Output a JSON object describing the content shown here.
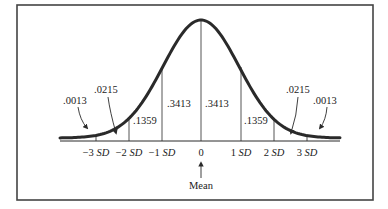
{
  "diagram": {
    "colors": {
      "line": "#2a2a2a",
      "border": "#444444",
      "background": "#ffffff"
    },
    "areas": {
      "center_left": ".3413",
      "center_right": ".3413",
      "mid_left": ".1359",
      "mid_right": ".1359",
      "outer_left": ".0215",
      "outer_right": ".0215",
      "tail_left": ".0013",
      "tail_right": ".0013"
    },
    "axis_ticks": [
      {
        "num": "−3",
        "unit": "SD"
      },
      {
        "num": "−2",
        "unit": "SD"
      },
      {
        "num": "−1",
        "unit": "SD"
      },
      {
        "num": "0",
        "unit": ""
      },
      {
        "num": "1",
        "unit": "SD"
      },
      {
        "num": "2",
        "unit": "SD"
      },
      {
        "num": "3",
        "unit": "SD"
      }
    ],
    "mean_label": "Mean"
  }
}
